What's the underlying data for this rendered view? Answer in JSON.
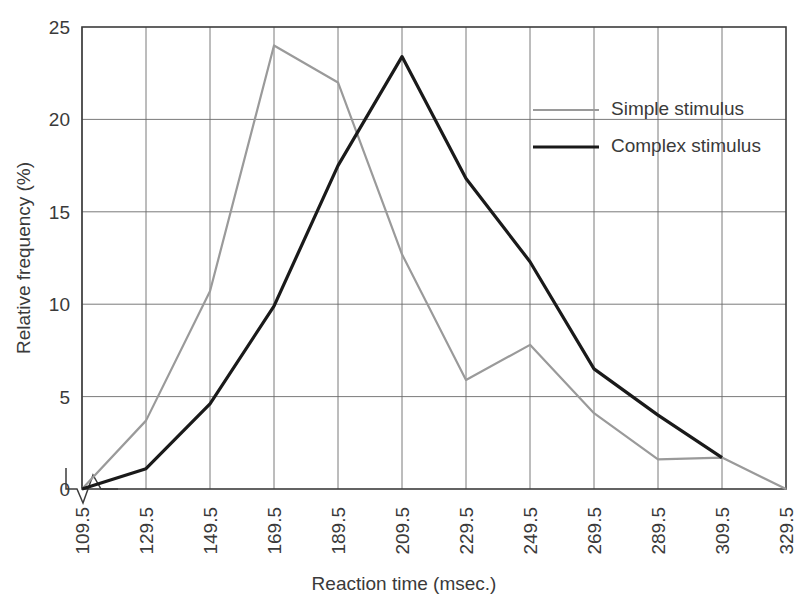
{
  "chart_data": {
    "type": "line",
    "title": "",
    "xlabel": "Reaction time (msec.)",
    "ylabel": "Relative frequency (%)",
    "categories": [
      "109.5",
      "129.5",
      "149.5",
      "169.5",
      "189.5",
      "209.5",
      "229.5",
      "249.5",
      "269.5",
      "289.5",
      "309.5",
      "329.5"
    ],
    "x": [
      109.5,
      129.5,
      149.5,
      169.5,
      189.5,
      209.5,
      229.5,
      249.5,
      269.5,
      289.5,
      309.5,
      329.5
    ],
    "xlim": [
      109.5,
      329.5
    ],
    "ylim": [
      0,
      25
    ],
    "yticks": [
      0,
      5,
      10,
      15,
      20,
      25
    ],
    "grid": true,
    "legend_position": "upper-right",
    "x_axis_break": true,
    "series": [
      {
        "name": "Simple stimulus",
        "color": "#9a9a9a",
        "line_width": 2.2,
        "values": [
          0,
          3.7,
          10.7,
          24.0,
          22.0,
          12.7,
          5.9,
          7.8,
          4.1,
          1.6,
          1.7,
          0
        ]
      },
      {
        "name": "Complex stimulus",
        "color": "#1a1a1a",
        "line_width": 3.2,
        "values": [
          0,
          1.1,
          4.6,
          9.9,
          17.5,
          23.4,
          16.8,
          12.3,
          6.5,
          4.0,
          1.7,
          null
        ]
      }
    ]
  },
  "axes": {
    "y_tick_labels": [
      "0",
      "5",
      "10",
      "15",
      "20",
      "25"
    ],
    "x_tick_labels": [
      "109.5",
      "129.5",
      "149.5",
      "169.5",
      "189.5",
      "209.5",
      "229.5",
      "249.5",
      "269.5",
      "289.5",
      "309.5",
      "329.5"
    ],
    "y_title": "Relative frequency (%)",
    "x_title": "Reaction time (msec.)"
  },
  "legend": {
    "entries": [
      {
        "label": "Simple stimulus",
        "color": "#9a9a9a",
        "width": 2.2
      },
      {
        "label": "Complex stimulus",
        "color": "#1a1a1a",
        "width": 3.2
      }
    ]
  },
  "colors": {
    "simple_stimulus": "#9a9a9a",
    "complex_stimulus": "#1a1a1a",
    "grid": "#6b6b6b",
    "frame": "#3c3c3c",
    "text": "#3a3a3a",
    "background": "#ffffff"
  }
}
